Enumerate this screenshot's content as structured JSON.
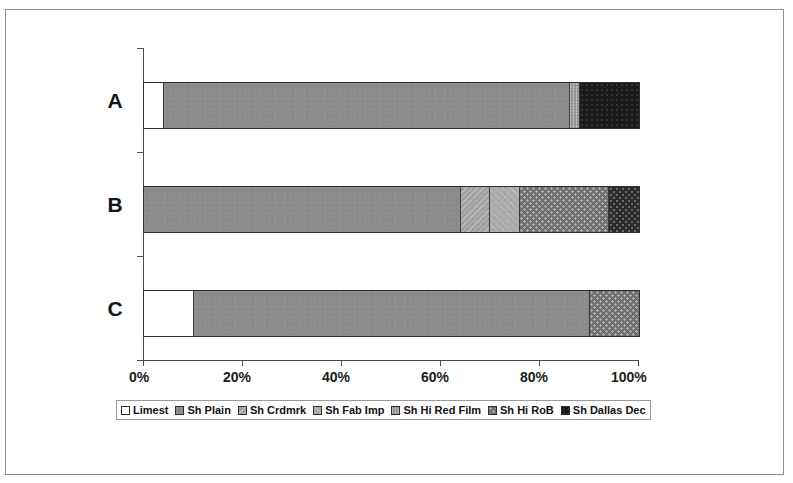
{
  "chart_data": {
    "type": "bar",
    "orientation": "horizontal",
    "stacked": true,
    "normalized": "100%",
    "title": "",
    "xlabel": "",
    "ylabel": "",
    "xlim": [
      0,
      100
    ],
    "grid": false,
    "legend_position": "bottom",
    "categories": [
      "A",
      "B",
      "C"
    ],
    "x_tick_labels": [
      "0%",
      "20%",
      "40%",
      "60%",
      "80%",
      "100%"
    ],
    "x_tick_values": [
      0,
      20,
      40,
      60,
      80,
      100
    ],
    "series": [
      {
        "name": "Limest",
        "key": "limest",
        "color": "#ffffff",
        "values": [
          4,
          0,
          10
        ]
      },
      {
        "name": "Sh Plain",
        "key": "plain",
        "color": "#8b8b8b",
        "values": [
          82,
          64,
          80
        ]
      },
      {
        "name": "Sh Crdmrk",
        "key": "crdmrk",
        "color": "#a2a2a2",
        "values": [
          0,
          6,
          0
        ]
      },
      {
        "name": "Sh Fab Imp",
        "key": "fabimp",
        "color": "#ababab",
        "values": [
          0,
          6,
          0
        ]
      },
      {
        "name": "Sh Hi Red Film",
        "key": "redfilm",
        "color": "#9b9b9b",
        "values": [
          2,
          0,
          0
        ]
      },
      {
        "name": "Sh Hi RoB",
        "key": "rob",
        "color": "#6f6f6f",
        "values": [
          0,
          18,
          10
        ]
      },
      {
        "name": "Sh Dallas Dec",
        "key": "dallas",
        "color": "#1a1a1a",
        "values": [
          12,
          6,
          0
        ]
      }
    ]
  },
  "axis": {
    "ticks": [
      {
        "label": "0%",
        "value": 0
      },
      {
        "label": "20%",
        "value": 20
      },
      {
        "label": "40%",
        "value": 40
      },
      {
        "label": "60%",
        "value": 60
      },
      {
        "label": "80%",
        "value": 80
      },
      {
        "label": "100%",
        "value": 100
      }
    ]
  },
  "categories": [
    {
      "label": "A"
    },
    {
      "label": "B"
    },
    {
      "label": "C"
    }
  ],
  "legend": {
    "entries": [
      {
        "label": "Limest"
      },
      {
        "label": "Sh Plain"
      },
      {
        "label": "Sh Crdmrk"
      },
      {
        "label": "Sh Fab Imp"
      },
      {
        "label": "Sh Hi Red Film"
      },
      {
        "label": "Sh Hi RoB"
      },
      {
        "label": "Sh Dallas Dec"
      }
    ]
  }
}
